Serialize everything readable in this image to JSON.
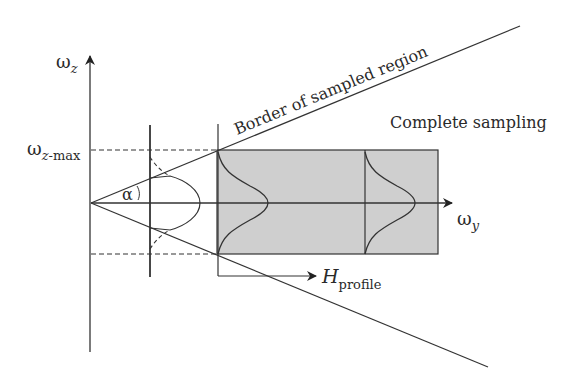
{
  "diagram": {
    "axis_z_label": "ω",
    "axis_z_sub": "z",
    "axis_y_label": "ω",
    "axis_y_sub": "y",
    "zmax_label": "ω",
    "zmax_sub": "z",
    "zmax_sub2": "-max",
    "angle_label": "α",
    "border_label": "Border of sampled region",
    "complete_label": "Complete sampling",
    "hprofile_label": "H",
    "hprofile_sub": "profile",
    "colors": {
      "line": "#333333",
      "shade": "#cfcfcf"
    }
  }
}
